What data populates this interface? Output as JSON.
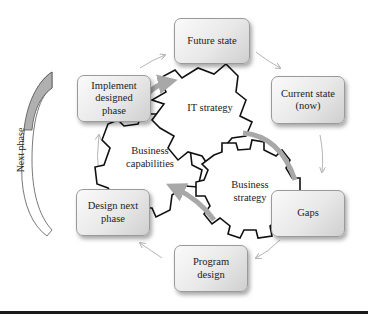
{
  "diagram": {
    "type": "cycle-with-gears",
    "side_label": "Next phase",
    "cycle_steps": [
      {
        "id": "future-state",
        "label": "Future state"
      },
      {
        "id": "current-state",
        "label": "Current state\n(now)"
      },
      {
        "id": "gaps",
        "label": "Gaps"
      },
      {
        "id": "program-design",
        "label": "Program\ndesign"
      },
      {
        "id": "design-next-phase",
        "label": "Design next\nphase"
      },
      {
        "id": "implement-designed-phase",
        "label": "Implement\ndesigned\nphase"
      }
    ],
    "gears": [
      {
        "id": "it-strategy",
        "label": "IT strategy"
      },
      {
        "id": "business-capabilities",
        "label": "Business\ncapabilities"
      },
      {
        "id": "business-strategy",
        "label": "Business\nstrategy"
      }
    ],
    "colors": {
      "box_fill": "#e8e8e8",
      "box_border": "#9a9a9a",
      "gear_stroke": "#111111",
      "arc_gray": "#a8a8a8",
      "arrow_gray": "#b5b5b5",
      "rule": "#1a1a1a"
    }
  }
}
